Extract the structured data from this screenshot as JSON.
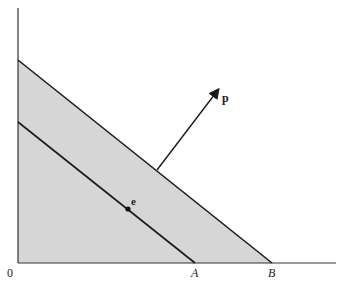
{
  "diagram": {
    "origin_label": "0",
    "labels": {
      "A": "A",
      "B": "B",
      "p": "p",
      "e": "e"
    },
    "colors": {
      "band_fill": "#d6d6d6",
      "lower_fill": "#d9d9d9",
      "line": "#1a1a1a",
      "axis": "#333333"
    }
  }
}
